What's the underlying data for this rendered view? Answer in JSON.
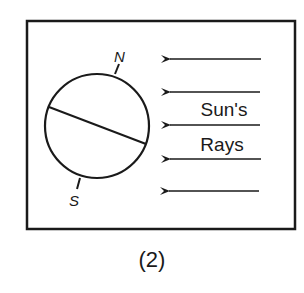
{
  "figure": {
    "caption": "(2)",
    "frame": {
      "x": 27,
      "y": 21,
      "width": 268,
      "height": 208,
      "stroke": "#1a1a1a"
    },
    "earth": {
      "center": {
        "x": 97,
        "y": 126
      },
      "radius": 52,
      "equator": {
        "x1": 49,
        "y1": 107,
        "x2": 145,
        "y2": 144
      },
      "north_label": "N",
      "south_label": "S",
      "north_axis": {
        "x1": 115,
        "y1": 74,
        "x2": 119,
        "y2": 64
      },
      "south_axis": {
        "x1": 80,
        "y1": 178,
        "x2": 77,
        "y2": 189
      }
    },
    "sun_rays": {
      "label_line1": "Sun's",
      "label_line2": "Rays",
      "direction": "right-to-left",
      "arrows_y": [
        59,
        92,
        125,
        159,
        191
      ],
      "x_start": 261,
      "x_end": 168
    }
  }
}
